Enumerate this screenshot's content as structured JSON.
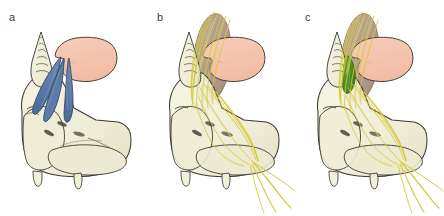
{
  "figure": {
    "panel_count": 3,
    "background_color": "#ffffff",
    "width": 443,
    "height": 216
  },
  "palette": {
    "bone_fill": "#F2F0DC",
    "bone_fill_dark": "#E6E3C8",
    "bone_outline": "#3b3a32",
    "organ_pink": "#F5C4AE",
    "organ_pink_outline": "#4a4038",
    "muscle_blue": "#5B7BA8",
    "muscle_blue_dark": "#47628C",
    "muscle_blue_outline": "#2f4565",
    "nerve_yellow": "#D4C93A",
    "nerve_yellow_light": "#E3DC7A",
    "tissue_mauve": "#A89080",
    "tissue_mauve_light": "#BCA694",
    "structure_green": "#4A8B20",
    "structure_green_outline": "#2f5d12",
    "label_text": "#3a3a3a"
  },
  "panels": [
    {
      "id": "a",
      "label": "a",
      "description": "Skull base with cochlea, pink organ and blue muscular structures",
      "structures": [
        {
          "name": "cochlea",
          "color": "#F2F0DC"
        },
        {
          "name": "sphenoid-bone",
          "color": "#F2F0DC"
        },
        {
          "name": "pink-organ",
          "color": "#F5C4AE"
        },
        {
          "name": "blue-muscle-band",
          "color": "#5B7BA8"
        }
      ]
    },
    {
      "id": "b",
      "label": "b",
      "description": "Same skull base with mauve tissue mass and yellow nerve fibers radiating downward",
      "structures": [
        {
          "name": "cochlea",
          "color": "#F2F0DC"
        },
        {
          "name": "sphenoid-bone",
          "color": "#F2F0DC"
        },
        {
          "name": "pink-organ",
          "color": "#F5C4AE"
        },
        {
          "name": "mauve-tissue-mass",
          "color": "#A89080"
        },
        {
          "name": "nerve-fiber-bundle",
          "color": "#D4C93A"
        }
      ]
    },
    {
      "id": "c",
      "label": "c",
      "description": "Same as panel b with an additional green structure adjacent to the pink organ",
      "structures": [
        {
          "name": "cochlea",
          "color": "#F2F0DC"
        },
        {
          "name": "sphenoid-bone",
          "color": "#F2F0DC"
        },
        {
          "name": "pink-organ",
          "color": "#F5C4AE"
        },
        {
          "name": "mauve-tissue-mass",
          "color": "#A89080"
        },
        {
          "name": "nerve-fiber-bundle",
          "color": "#D4C93A"
        },
        {
          "name": "green-structure",
          "color": "#4A8B20"
        }
      ]
    }
  ]
}
